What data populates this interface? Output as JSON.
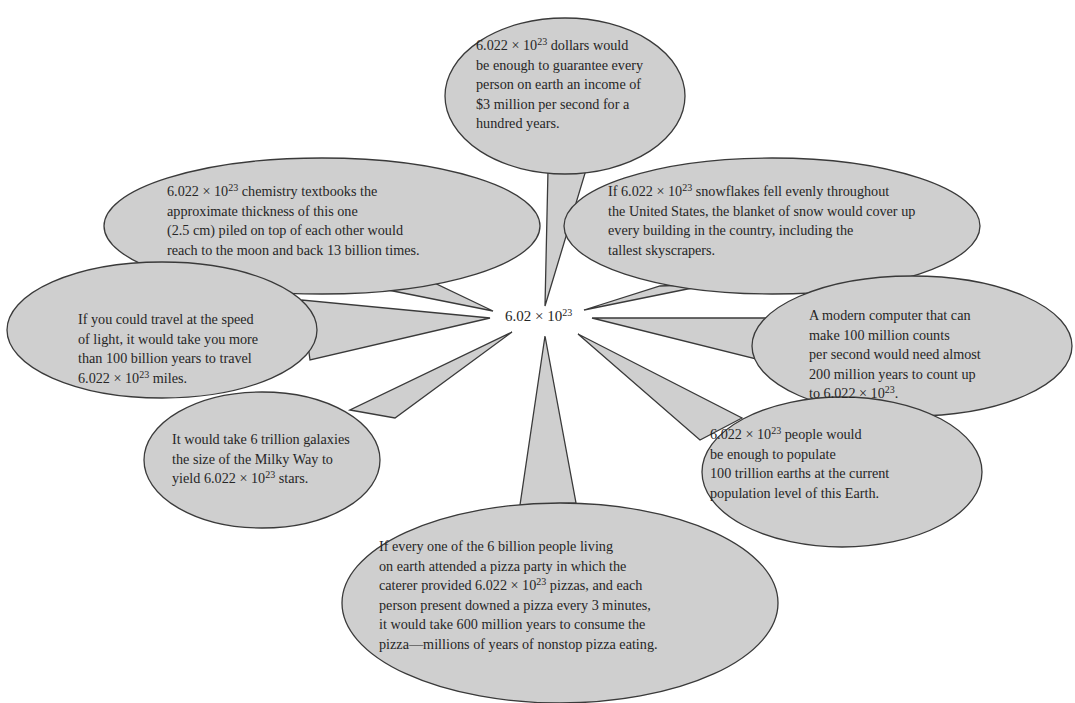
{
  "figure": {
    "center": {
      "label": "6.02 × 10",
      "exponent": "23",
      "x": 505,
      "y": 308
    },
    "colors": {
      "bubble_fill": "#cfcfcf",
      "bubble_stroke": "#3a3a3a",
      "text": "#262626",
      "background": "#ffffff"
    },
    "bubbles": [
      {
        "id": "dollars",
        "ellipse": {
          "cx": 565,
          "cy": 96,
          "rx": 120,
          "ry": 78
        },
        "pointer": [
          [
            548,
            170
          ],
          [
            586,
            170
          ],
          [
            545,
            306
          ]
        ],
        "text_pos": {
          "x": 476,
          "y": 36
        },
        "lines": [
          {
            "pre": "6.022 × 10",
            "sup": "23",
            "post": " dollars would"
          },
          {
            "pre": "be enough to guarantee every"
          },
          {
            "pre": "person on earth an income of"
          },
          {
            "pre": "$3 million per second for a"
          },
          {
            "pre": "hundred years."
          }
        ]
      },
      {
        "id": "textbooks",
        "ellipse": {
          "cx": 322,
          "cy": 226,
          "rx": 218,
          "ry": 68
        },
        "pointer": [
          [
            378,
            288
          ],
          [
            428,
            280
          ],
          [
            493,
            311
          ]
        ],
        "text_pos": {
          "x": 167,
          "y": 182
        },
        "lines": [
          {
            "pre": "6.022 × 10",
            "sup": "23",
            "post": " chemistry textbooks the"
          },
          {
            "pre": "approximate thickness of this one"
          },
          {
            "pre": "(2.5 cm) piled on top of each other would"
          },
          {
            "pre": "reach to the moon and back 13 billion times."
          }
        ]
      },
      {
        "id": "snowflakes",
        "ellipse": {
          "cx": 772,
          "cy": 226,
          "rx": 208,
          "ry": 68
        },
        "pointer": [
          [
            660,
            286
          ],
          [
            712,
            284
          ],
          [
            584,
            310
          ]
        ],
        "text_pos": {
          "x": 608,
          "y": 182
        },
        "lines": [
          {
            "pre": "If 6.022 × 10",
            "sup": "23",
            "post": " snowflakes fell evenly throughout"
          },
          {
            "pre": "the United States, the blanket of snow would cover up"
          },
          {
            "pre": "every building in the country, including the"
          },
          {
            "pre": "tallest skyscrapers."
          }
        ]
      },
      {
        "id": "light",
        "ellipse": {
          "cx": 162,
          "cy": 330,
          "rx": 155,
          "ry": 68
        },
        "pointer": [
          [
            302,
            300
          ],
          [
            310,
            360
          ],
          [
            490,
            318
          ]
        ],
        "text_pos": {
          "x": 78,
          "y": 310
        },
        "lines": [
          {
            "pre": "If you could travel at the speed"
          },
          {
            "pre": "of light, it would take you more"
          },
          {
            "pre": "than 100 billion years to travel"
          },
          {
            "pre": "6.022 × 10",
            "sup": "23",
            "post": " miles."
          }
        ]
      },
      {
        "id": "computer",
        "ellipse": {
          "cx": 912,
          "cy": 346,
          "rx": 160,
          "ry": 70
        },
        "pointer": [
          [
            768,
            318
          ],
          [
            760,
            360
          ],
          [
            592,
            318
          ]
        ],
        "text_pos": {
          "x": 809,
          "y": 306
        },
        "lines": [
          {
            "pre": "A modern computer that can"
          },
          {
            "pre": "make 100 million counts"
          },
          {
            "pre": "per second would need almost"
          },
          {
            "pre": "200 million years to count up"
          },
          {
            "pre": "to 6.022 × 10",
            "sup": "23",
            "post": "."
          }
        ]
      },
      {
        "id": "galaxies",
        "ellipse": {
          "cx": 262,
          "cy": 460,
          "rx": 118,
          "ry": 68
        },
        "pointer": [
          [
            350,
            410
          ],
          [
            395,
            418
          ],
          [
            512,
            332
          ]
        ],
        "text_pos": {
          "x": 172,
          "y": 430
        },
        "lines": [
          {
            "pre": "It would take 6 trillion galaxies"
          },
          {
            "pre": "the size of the Milky Way to"
          },
          {
            "pre": "yield 6.022 × 10",
            "sup": "23",
            "post": " stars."
          }
        ]
      },
      {
        "id": "people",
        "ellipse": {
          "cx": 842,
          "cy": 472,
          "rx": 140,
          "ry": 75
        },
        "pointer": [
          [
            742,
            418
          ],
          [
            700,
            440
          ],
          [
            578,
            334
          ]
        ],
        "text_pos": {
          "x": 710,
          "y": 425
        },
        "lines": [
          {
            "pre": "6.022 × 10",
            "sup": "23",
            "post": " people would"
          },
          {
            "pre": "be enough to populate"
          },
          {
            "pre": "100 trillion earths at the current"
          },
          {
            "pre": "population level of this Earth."
          }
        ]
      },
      {
        "id": "pizza",
        "ellipse": {
          "cx": 560,
          "cy": 603,
          "rx": 218,
          "ry": 100
        },
        "pointer": [
          [
            520,
            505
          ],
          [
            576,
            503
          ],
          [
            545,
            336
          ]
        ],
        "text_pos": {
          "x": 379,
          "y": 537
        },
        "lines": [
          {
            "pre": "If every one of the 6 billion people living"
          },
          {
            "pre": "on earth attended a pizza party in which the"
          },
          {
            "pre": "caterer provided 6.022 × 10",
            "sup": "23",
            "post": " pizzas, and each"
          },
          {
            "pre": "person present downed a pizza every 3 minutes,"
          },
          {
            "pre": "it would take 600 million years to consume the"
          },
          {
            "pre": "pizza—millions of years of nonstop pizza eating."
          }
        ]
      }
    ]
  }
}
